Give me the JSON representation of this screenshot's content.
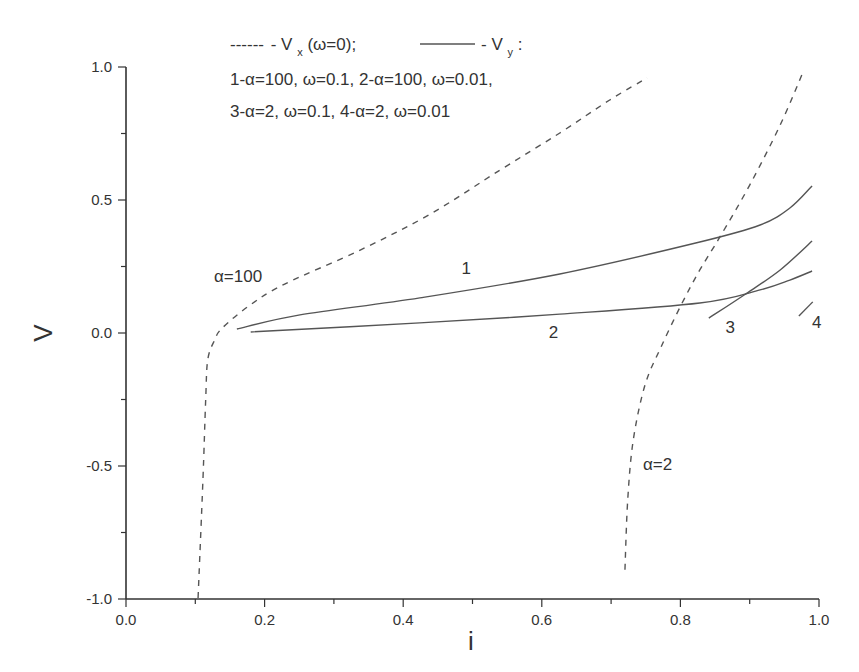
{
  "chart_data": {
    "type": "line",
    "title": "",
    "xlabel": "i",
    "ylabel": "V",
    "xlim": [
      0.0,
      1.0
    ],
    "ylim": [
      -1.0,
      1.0
    ],
    "grid": false,
    "frame": "left-bottom axes only",
    "x_ticks": [
      "0.0",
      "0.2",
      "0.4",
      "0.6",
      "0.8",
      "1.0"
    ],
    "y_ticks": [
      "-1.0",
      "-0.5",
      "0.0",
      "0.5",
      "1.0"
    ],
    "legend": {
      "position": "top",
      "line1": {
        "dashed_sample": "------",
        "dashed_label_prefix": "- V",
        "dashed_label_sub": "x",
        "dashed_label_suffix": "(ω=0);",
        "solid_label_prefix": "- V",
        "solid_label_sub": "y",
        "solid_label_suffix": ":"
      },
      "line2": "1-α=100, ω=0.1, 2-α=100, ω=0.01,",
      "line3": "3-α=2, ω=0.1, 4-α=2, ω=0.01"
    },
    "annotations": [
      {
        "text": "α=100",
        "x": 0.127,
        "y": 0.19
      },
      {
        "text": "α=2",
        "x": 0.746,
        "y": -0.515
      },
      {
        "text": "1",
        "x": 0.484,
        "y": 0.22
      },
      {
        "text": "2",
        "x": 0.61,
        "y": -0.02
      },
      {
        "text": "3",
        "x": 0.865,
        "y": -0.0
      },
      {
        "text": "4",
        "x": 0.99,
        "y": 0.02
      }
    ],
    "series": [
      {
        "name": "Vx (α=100, ω=0)",
        "style": "dashed",
        "x": [
          0.104,
          0.111,
          0.115,
          0.118,
          0.128,
          0.139,
          0.179,
          0.229,
          0.338,
          0.439,
          0.54,
          0.626,
          0.698,
          0.752
        ],
        "y": [
          -0.996,
          -0.553,
          -0.25,
          -0.1,
          -0.026,
          0.019,
          0.105,
          0.184,
          0.312,
          0.447,
          0.613,
          0.752,
          0.876,
          0.959
        ]
      },
      {
        "name": "Vx (α=2, ω=0)",
        "style": "dashed",
        "x": [
          0.72,
          0.724,
          0.732,
          0.749,
          0.772,
          0.801,
          0.828,
          0.857,
          0.9,
          0.944,
          0.977
        ],
        "y": [
          -0.89,
          -0.627,
          -0.402,
          -0.195,
          -0.053,
          0.105,
          0.237,
          0.361,
          0.556,
          0.782,
          0.981
        ]
      },
      {
        "name": "1: Vy α=100, ω=0.1",
        "style": "solid",
        "x": [
          0.16,
          0.251,
          0.424,
          0.626,
          0.828,
          0.915,
          0.958,
          0.99
        ],
        "y": [
          0.015,
          0.068,
          0.132,
          0.222,
          0.342,
          0.406,
          0.47,
          0.553
        ]
      },
      {
        "name": "2: Vy α=100, ω=0.01",
        "style": "solid",
        "x": [
          0.18,
          0.424,
          0.626,
          0.828,
          0.915,
          0.958,
          0.99
        ],
        "y": [
          0.004,
          0.038,
          0.071,
          0.113,
          0.162,
          0.199,
          0.233
        ]
      },
      {
        "name": "3: Vy α=2, ω=0.1",
        "style": "solid",
        "x": [
          0.841,
          0.892,
          0.944,
          0.99
        ],
        "y": [
          0.056,
          0.143,
          0.237,
          0.346
        ]
      },
      {
        "name": "4: Vy α=2, ω=0.01",
        "style": "solid",
        "x": [
          0.971,
          0.991
        ],
        "y": [
          0.064,
          0.117
        ]
      }
    ],
    "colors": {
      "axis": "#333333",
      "lines": "#555555",
      "text": "#333333"
    }
  }
}
